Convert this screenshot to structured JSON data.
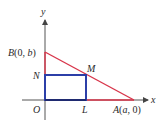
{
  "figure": {
    "axes": {
      "x_label": "x",
      "y_label": "y",
      "origin_label": "O"
    },
    "points": {
      "B": {
        "name": "B",
        "open": "(0, ",
        "coord": "b",
        "close": ")"
      },
      "A": {
        "name": "A",
        "open": "(",
        "coord": "a",
        "close": ", 0)"
      },
      "N": {
        "name": "N"
      },
      "M": {
        "name": "M"
      },
      "L": {
        "name": "L"
      }
    },
    "colors": {
      "triangle": "#d8354a",
      "rectangle": "#2c3fa8",
      "axis": "#555555",
      "text": "#2a2a2a"
    }
  }
}
